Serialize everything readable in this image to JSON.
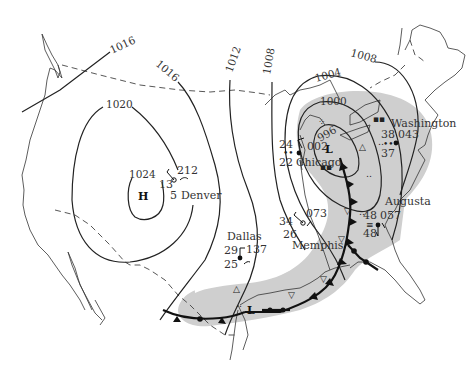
{
  "map": {
    "type": "surface weather map",
    "region": "United States",
    "colors": {
      "precip_shading": "#cfcfcf",
      "line": "#222222",
      "background": "#ffffff"
    },
    "isobars": [
      {
        "label": "1016",
        "pos": "northwest (straight line)"
      },
      {
        "label": "1016",
        "pos": "north-central"
      },
      {
        "label": "1012",
        "pos": "central"
      },
      {
        "label": "1008",
        "pos": "central-east"
      },
      {
        "label": "1004",
        "pos": "Great Lakes"
      },
      {
        "label": "1008",
        "pos": "northeast"
      },
      {
        "label": "1020",
        "pos": "west"
      },
      {
        "label": "1024",
        "pos": "around High"
      },
      {
        "label": "1000",
        "pos": "around Low"
      },
      {
        "label": "996",
        "pos": "inner Low"
      }
    ],
    "pressure_centers": [
      {
        "symbol": "H",
        "name": "high-pressure-center"
      },
      {
        "symbol": "L",
        "name": "low-pressure-center-great-lakes"
      },
      {
        "symbol": "L",
        "name": "low-pressure-center-gulf"
      }
    ],
    "stations": [
      {
        "city": "Denver",
        "temp": "13",
        "dewpoint": "5",
        "pressure": "212"
      },
      {
        "city": "Dallas",
        "temp": "29",
        "dewpoint": "25",
        "pressure": "137"
      },
      {
        "city": "Chicago",
        "temp": "24",
        "dewpoint": "22",
        "pressure": "002"
      },
      {
        "city": "Memphis",
        "temp": "34",
        "dewpoint": "26",
        "pressure": "073"
      },
      {
        "city": "Washington",
        "temp": "38",
        "dewpoint": "37",
        "pressure": "043"
      },
      {
        "city": "Augusta",
        "temp": "48",
        "dewpoint": "48",
        "pressure": "057"
      }
    ],
    "labels": {
      "high": "H",
      "low": "L",
      "iso_1016a": "1016",
      "iso_1016b": "1016",
      "iso_1012": "1012",
      "iso_1008a": "1008",
      "iso_1004": "1004",
      "iso_1008b": "1008",
      "iso_1020": "1020",
      "iso_1024": "1024",
      "iso_1000": "1000",
      "iso_996": "996"
    }
  }
}
